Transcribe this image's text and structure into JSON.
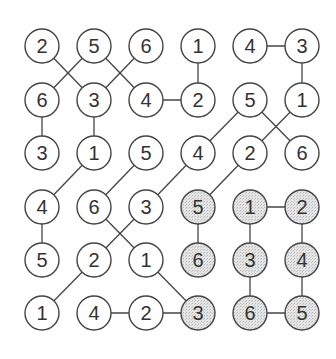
{
  "puzzle": {
    "rows": 6,
    "cols": 6,
    "colors": {
      "background": "#ffffff",
      "circle_fill": "#ffffff",
      "shaded_fill": "#d8d8d8",
      "stroke": "#444444",
      "text": "#333333"
    },
    "grid": [
      [
        2,
        5,
        6,
        1,
        4,
        3
      ],
      [
        6,
        3,
        4,
        2,
        5,
        1
      ],
      [
        3,
        1,
        5,
        4,
        2,
        6
      ],
      [
        4,
        6,
        3,
        5,
        1,
        2
      ],
      [
        5,
        2,
        1,
        6,
        3,
        4
      ],
      [
        1,
        4,
        2,
        3,
        6,
        5
      ]
    ],
    "shaded": [
      [
        3,
        3
      ],
      [
        3,
        4
      ],
      [
        3,
        5
      ],
      [
        4,
        3
      ],
      [
        4,
        4
      ],
      [
        4,
        5
      ],
      [
        5,
        3
      ],
      [
        5,
        4
      ],
      [
        5,
        5
      ]
    ],
    "connections": [
      [
        [
          0,
          0
        ],
        [
          1,
          1
        ]
      ],
      [
        [
          0,
          1
        ],
        [
          1,
          0
        ]
      ],
      [
        [
          0,
          1
        ],
        [
          1,
          2
        ]
      ],
      [
        [
          0,
          2
        ],
        [
          1,
          1
        ]
      ],
      [
        [
          0,
          3
        ],
        [
          1,
          3
        ]
      ],
      [
        [
          0,
          4
        ],
        [
          0,
          5
        ]
      ],
      [
        [
          0,
          5
        ],
        [
          1,
          5
        ]
      ],
      [
        [
          1,
          0
        ],
        [
          2,
          0
        ]
      ],
      [
        [
          1,
          1
        ],
        [
          2,
          1
        ]
      ],
      [
        [
          1,
          2
        ],
        [
          1,
          3
        ]
      ],
      [
        [
          1,
          4
        ],
        [
          2,
          3
        ]
      ],
      [
        [
          1,
          4
        ],
        [
          2,
          5
        ]
      ],
      [
        [
          1,
          5
        ],
        [
          2,
          4
        ]
      ],
      [
        [
          2,
          1
        ],
        [
          3,
          0
        ]
      ],
      [
        [
          2,
          2
        ],
        [
          3,
          1
        ]
      ],
      [
        [
          2,
          3
        ],
        [
          3,
          2
        ]
      ],
      [
        [
          2,
          4
        ],
        [
          3,
          3
        ]
      ],
      [
        [
          3,
          0
        ],
        [
          4,
          0
        ]
      ],
      [
        [
          3,
          1
        ],
        [
          4,
          2
        ]
      ],
      [
        [
          3,
          2
        ],
        [
          4,
          1
        ]
      ],
      [
        [
          3,
          3
        ],
        [
          4,
          3
        ]
      ],
      [
        [
          3,
          4
        ],
        [
          3,
          5
        ]
      ],
      [
        [
          3,
          4
        ],
        [
          4,
          4
        ]
      ],
      [
        [
          3,
          5
        ],
        [
          4,
          5
        ]
      ],
      [
        [
          4,
          1
        ],
        [
          5,
          0
        ]
      ],
      [
        [
          4,
          2
        ],
        [
          5,
          3
        ]
      ],
      [
        [
          4,
          4
        ],
        [
          5,
          4
        ]
      ],
      [
        [
          4,
          5
        ],
        [
          5,
          5
        ]
      ],
      [
        [
          5,
          1
        ],
        [
          5,
          2
        ]
      ],
      [
        [
          5,
          2
        ],
        [
          5,
          3
        ]
      ],
      [
        [
          5,
          4
        ],
        [
          5,
          5
        ]
      ]
    ]
  }
}
